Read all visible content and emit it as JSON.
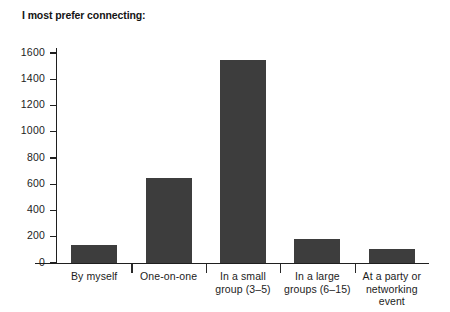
{
  "chart_data": {
    "type": "bar",
    "title": "I most prefer connecting:",
    "xlabel": "",
    "ylabel": "",
    "categories": [
      "By myself",
      "One-on-one",
      "In a small group (3–5)",
      "In a large groups (6–15)",
      "At a party or networking event"
    ],
    "category_lines": [
      [
        "By myself"
      ],
      [
        "One-on-one"
      ],
      [
        "In a small",
        "group (3–5)"
      ],
      [
        "In a large",
        "groups (6–15)"
      ],
      [
        "At a party or",
        "networking",
        "event"
      ]
    ],
    "values": [
      135,
      650,
      1550,
      180,
      105
    ],
    "ylim": [
      0,
      1600
    ],
    "yticks": [
      0,
      200,
      400,
      600,
      800,
      1000,
      1200,
      1400,
      1600
    ],
    "ytick_labels": [
      "0",
      "200",
      "400",
      "600",
      "800",
      "1000",
      "1200",
      "1400",
      "1600"
    ],
    "grid": false,
    "legend": null,
    "bar_color": "#3d3d3d",
    "axis_color": "#1f1f1f",
    "background_color": "#ffffff",
    "text_color": "#1c1c1c"
  }
}
